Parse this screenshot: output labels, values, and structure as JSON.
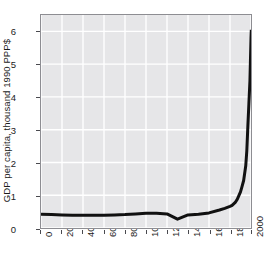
{
  "figure": {
    "background_color": "#ffffff",
    "title_remnant": "",
    "plot_background_color": "#e6e6e8",
    "grid_color": "#ffffff",
    "frame_color": "#8d8d92",
    "line_color": "#111111"
  },
  "chart_data": {
    "type": "line",
    "title": "",
    "xlabel": "",
    "ylabel": "GDP per capita, thousand 1990 PPP$",
    "xlim": [
      0,
      2000
    ],
    "ylim": [
      0,
      6.5
    ],
    "xticks": [
      0,
      200,
      400,
      600,
      800,
      1000,
      1200,
      1400,
      1600,
      1800,
      2000
    ],
    "xtick_labels": [
      "0",
      "200",
      "400",
      "600",
      "800",
      "1000",
      "1200",
      "1400",
      "1600",
      "1800",
      "2000"
    ],
    "yticks": [
      0,
      1,
      2,
      3,
      4,
      5,
      6
    ],
    "ytick_labels": [
      "0",
      "1",
      "2",
      "3",
      "4",
      "5",
      "6"
    ],
    "grid": true,
    "legend": null,
    "series": [
      {
        "name": "GDP per capita",
        "color": "#111111",
        "line_width": 3,
        "x": [
          0,
          100,
          200,
          300,
          400,
          500,
          600,
          700,
          800,
          900,
          1000,
          1100,
          1200,
          1300,
          1400,
          1500,
          1600,
          1700,
          1750,
          1800,
          1820,
          1850,
          1870,
          1900,
          1913,
          1930,
          1950,
          1960,
          1970,
          1980,
          1990,
          2000,
          2003
        ],
        "y": [
          0.42,
          0.41,
          0.4,
          0.39,
          0.39,
          0.39,
          0.39,
          0.4,
          0.41,
          0.43,
          0.45,
          0.45,
          0.43,
          0.27,
          0.4,
          0.42,
          0.46,
          0.55,
          0.6,
          0.66,
          0.69,
          0.78,
          0.88,
          1.1,
          1.25,
          1.45,
          1.9,
          2.35,
          3.1,
          3.8,
          4.5,
          5.8,
          6.05
        ]
      }
    ]
  }
}
